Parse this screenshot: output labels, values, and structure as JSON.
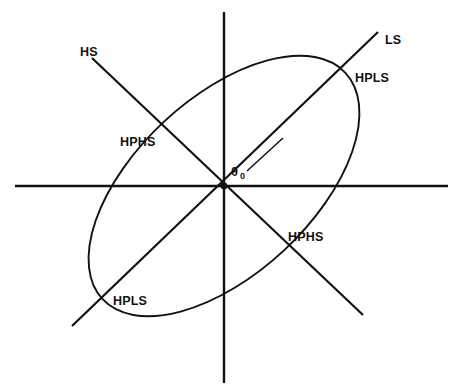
{
  "figure": {
    "type": "geometric-diagram",
    "background_color": "#ffffff",
    "stroke_color": "#111111",
    "width": 459,
    "height": 390
  },
  "axes": {
    "horizontal": {
      "name": "horizontal-axis",
      "x1": 15,
      "y1": 186,
      "x2": 448,
      "y2": 186
    },
    "vertical": {
      "name": "vertical-axis",
      "x1": 224,
      "y1": 12,
      "x2": 224,
      "y2": 383
    },
    "origin": {
      "x": 224,
      "y": 186
    }
  },
  "lines": [
    {
      "id": "ls-line",
      "label": "LS",
      "x1": 72,
      "y1": 326,
      "x2": 378,
      "y2": 32
    },
    {
      "id": "hs-line",
      "label": "HS",
      "x1": 92,
      "y1": 58,
      "x2": 363,
      "y2": 315
    }
  ],
  "ellipse": {
    "name": "tilted-ellipse",
    "center_x": 224,
    "center_y": 186,
    "semi_major": 166,
    "semi_minor": 88,
    "rotation_deg": -43
  },
  "angle": {
    "symbol": "θ",
    "subscript": "0",
    "label_x": 231,
    "label_y": 176,
    "ray": {
      "x1": 247,
      "y1": 171,
      "x2": 283,
      "y2": 138
    }
  },
  "labels": [
    {
      "id": "label-hs",
      "text": "HS",
      "x": 80,
      "y": 56,
      "anchor": "start"
    },
    {
      "id": "label-ls",
      "text": "LS",
      "x": 385,
      "y": 44,
      "anchor": "start"
    },
    {
      "id": "label-hpls-top",
      "text": "HPLS",
      "x": 355,
      "y": 82,
      "anchor": "start"
    },
    {
      "id": "label-hphs-top",
      "text": "HPHS",
      "x": 120,
      "y": 146,
      "anchor": "start"
    },
    {
      "id": "label-hphs-bot",
      "text": "HPHS",
      "x": 288,
      "y": 241,
      "anchor": "start"
    },
    {
      "id": "label-hpls-bot",
      "text": "HPLS",
      "x": 113,
      "y": 305,
      "anchor": "start"
    }
  ]
}
